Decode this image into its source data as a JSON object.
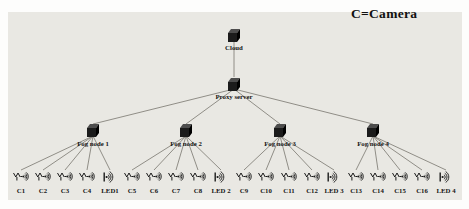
{
  "legend": {
    "text": "C=Camera"
  },
  "colors": {
    "panel": "#e9e8e3",
    "edge": "#78766e",
    "node_front": "#1b1b1b",
    "node_top": "#4d4d4d",
    "node_side": "#000000",
    "icon": "#1a1a1a",
    "label_text": "#151515"
  },
  "diagram": {
    "cloud": {
      "label": "Cloud",
      "x": 234,
      "y": 35
    },
    "proxy": {
      "label": "Proxy server",
      "x": 234,
      "y": 84
    },
    "fog_nodes": [
      {
        "label": "Fog node 1",
        "x": 93,
        "y": 130
      },
      {
        "label": "Fog node 2",
        "x": 186,
        "y": 130
      },
      {
        "label": "Fog node 3",
        "x": 280,
        "y": 130
      },
      {
        "label": "Fog node 4",
        "x": 373,
        "y": 130
      }
    ],
    "devices": [
      {
        "label": "C1",
        "type": "camera",
        "x": 21,
        "fog": 0
      },
      {
        "label": "C2",
        "type": "camera",
        "x": 43,
        "fog": 0
      },
      {
        "label": "C3",
        "type": "camera",
        "x": 65,
        "fog": 0
      },
      {
        "label": "C4",
        "type": "camera",
        "x": 87,
        "fog": 0
      },
      {
        "label": "LED1",
        "type": "led",
        "x": 110,
        "fog": 0
      },
      {
        "label": "C5",
        "type": "camera",
        "x": 132,
        "fog": 1
      },
      {
        "label": "C6",
        "type": "camera",
        "x": 154,
        "fog": 1
      },
      {
        "label": "C7",
        "type": "camera",
        "x": 176,
        "fog": 1
      },
      {
        "label": "C8",
        "type": "camera",
        "x": 198,
        "fog": 1
      },
      {
        "label": "LED 2",
        "type": "led",
        "x": 221,
        "fog": 1
      },
      {
        "label": "C9",
        "type": "camera",
        "x": 244,
        "fog": 2
      },
      {
        "label": "C10",
        "type": "camera",
        "x": 266,
        "fog": 2
      },
      {
        "label": "C11",
        "type": "camera",
        "x": 289,
        "fog": 2
      },
      {
        "label": "C12",
        "type": "camera",
        "x": 312,
        "fog": 2
      },
      {
        "label": "LED 3",
        "type": "led",
        "x": 334,
        "fog": 2
      },
      {
        "label": "C13",
        "type": "camera",
        "x": 356,
        "fog": 3
      },
      {
        "label": "C14",
        "type": "camera",
        "x": 378,
        "fog": 3
      },
      {
        "label": "C15",
        "type": "camera",
        "x": 400,
        "fog": 3
      },
      {
        "label": "C16",
        "type": "camera",
        "x": 422,
        "fog": 3
      },
      {
        "label": "LED 4",
        "type": "led",
        "x": 446,
        "fog": 3
      }
    ],
    "layout": {
      "device_icon_y": 177,
      "device_label_y": 193,
      "fog_label_dy": 16,
      "cloud_label_dy": 15,
      "proxy_label_dy": 15,
      "label_font_size": 6.8,
      "legend_font_size": 13.5
    }
  }
}
